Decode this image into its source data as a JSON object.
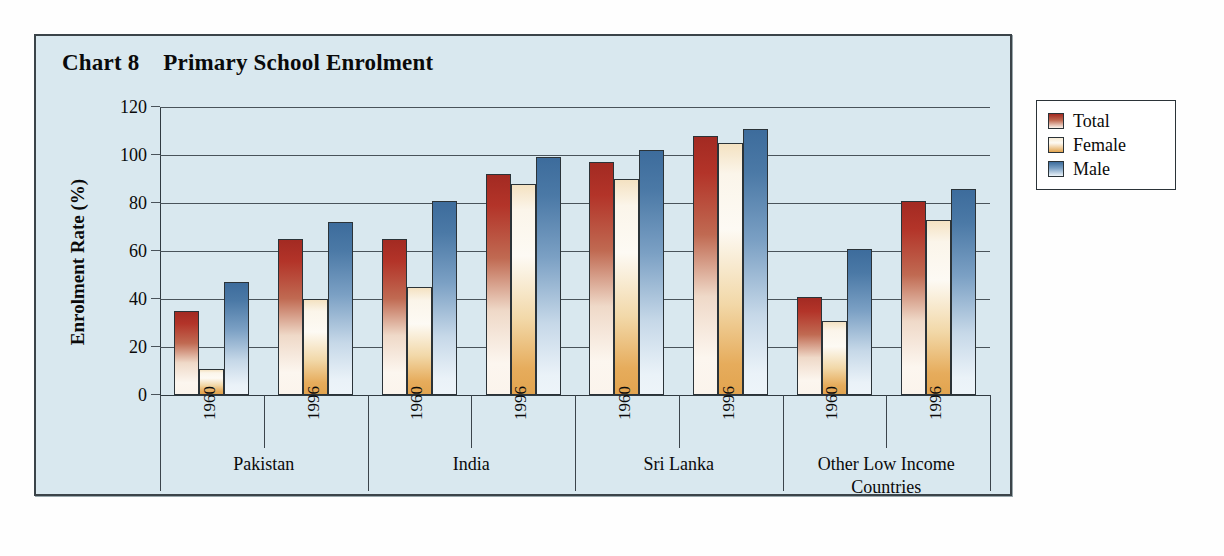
{
  "panel": {
    "title": "Chart 8    Primary School Enrolment",
    "background_color": "#d9e8ef",
    "border_color": "#3b4449"
  },
  "legend": {
    "position": "right",
    "items": [
      {
        "label": "Total",
        "color": "#b33429",
        "icon": "legend-swatch-total"
      },
      {
        "label": "Female",
        "color": "#e2a44f",
        "icon": "legend-swatch-female"
      },
      {
        "label": "Male",
        "color": "#4b79a6",
        "icon": "legend-swatch-male"
      }
    ]
  },
  "chart_data": {
    "type": "bar",
    "title": "Chart 8    Primary School Enrolment",
    "xlabel": "",
    "ylabel": "Enrolment Rate (%)",
    "ylim": [
      0,
      120
    ],
    "yticks": [
      0,
      20,
      40,
      60,
      80,
      100,
      120
    ],
    "ytick_labels": [
      "0",
      "20",
      "40",
      "60",
      "80",
      "100",
      "120"
    ],
    "grid": true,
    "grid_axis": "y",
    "legend_position": "right",
    "groups": [
      "Pakistan",
      "India",
      "Sri Lanka",
      "Other Low Income\nCountries"
    ],
    "subgroups": [
      "1960",
      "1996"
    ],
    "categories": [
      "Pakistan 1960",
      "Pakistan 1996",
      "India 1960",
      "India 1996",
      "Sri Lanka 1960",
      "Sri Lanka 1996",
      "Other Low Income Countries 1960",
      "Other Low Income Countries 1996"
    ],
    "series": [
      {
        "name": "Total",
        "color": "#b33429",
        "values": [
          35,
          65,
          65,
          92,
          97,
          108,
          41,
          81
        ]
      },
      {
        "name": "Female",
        "color": "#e2a44f",
        "values": [
          11,
          40,
          45,
          88,
          90,
          105,
          31,
          73
        ]
      },
      {
        "name": "Male",
        "color": "#4b79a6",
        "values": [
          47,
          72,
          81,
          99,
          102,
          111,
          61,
          86
        ]
      }
    ]
  }
}
